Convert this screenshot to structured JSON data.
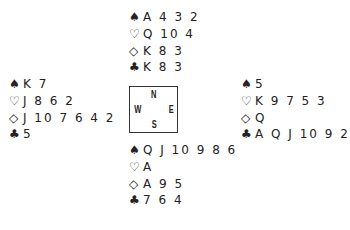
{
  "icons": {
    "spade": "♠",
    "heart": "♡",
    "diamond": "◇",
    "club": "♣"
  },
  "compass": {
    "north": "N",
    "west": "W",
    "east": "E",
    "south": "S"
  },
  "hands": {
    "north": {
      "spades": "A 4 3 2",
      "hearts": "Q 10 4",
      "diamonds": "K 8 3",
      "clubs": "K 8 3"
    },
    "west": {
      "spades": "K 7",
      "hearts": "J 8 6 2",
      "diamonds": "J 10 7 6 4 2",
      "clubs": "5"
    },
    "east": {
      "spades": "5",
      "hearts": "K 9 7 5 3",
      "diamonds": "Q",
      "clubs": "A Q J 10 9 2"
    },
    "south": {
      "spades": "Q J 10 9 8 6",
      "hearts": "A",
      "diamonds": "A 9 5",
      "clubs": "7 6 4"
    }
  }
}
